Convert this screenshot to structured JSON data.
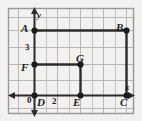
{
  "figure": {
    "background_color": "#f2f1ef",
    "grid_color": "#b9b7b4",
    "border_color": "#9a9894",
    "axis_color": "#2b2b2b",
    "shape_color": "#2b2b2b",
    "axis_labels": {
      "x": "x",
      "y": "y"
    },
    "tick_labels": {
      "origin": "0",
      "y_three": "3",
      "x_two": "2"
    },
    "points": [
      {
        "name": "A",
        "label": "A",
        "gx": 0,
        "gy": 5
      },
      {
        "name": "B",
        "label": "B",
        "gx": 6,
        "gy": 5
      },
      {
        "name": "C",
        "label": "C",
        "gx": 6,
        "gy": 0
      },
      {
        "name": "D",
        "label": "D",
        "gx": 0,
        "gy": 0
      },
      {
        "name": "E",
        "label": "E",
        "gx": 3,
        "gy": 0
      },
      {
        "name": "F",
        "label": "F",
        "gx": 0,
        "gy": 2
      },
      {
        "name": "G",
        "label": "G",
        "gx": 3,
        "gy": 2
      }
    ],
    "shapes": [
      {
        "name": "rectangle-ABCD",
        "vertices": [
          "A",
          "B",
          "C",
          "D"
        ]
      },
      {
        "name": "rectangle-FGED",
        "vertices": [
          "F",
          "G",
          "E",
          "D"
        ]
      }
    ]
  }
}
